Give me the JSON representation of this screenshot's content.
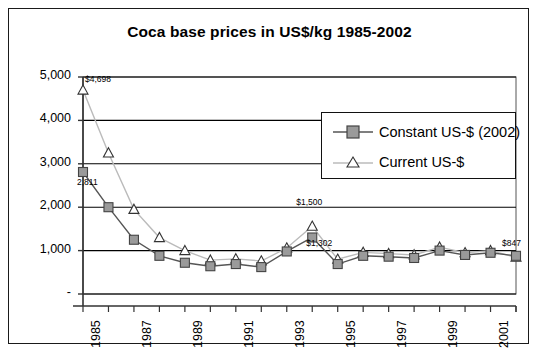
{
  "chart_data": {
    "type": "line",
    "title": "Coca base prices in US$/kg 1985-2002",
    "xlabel": "",
    "ylabel": "",
    "ylim": [
      0,
      5000
    ],
    "ytick_labels": [
      "5,000",
      "4,000",
      "3,000",
      "2,000",
      "1,000",
      "-"
    ],
    "ytick_values": [
      5000,
      4000,
      3000,
      2000,
      1000,
      0
    ],
    "grid": "horizontal",
    "legend_position": "upper-right-inside",
    "x": [
      1985,
      1986,
      1987,
      1988,
      1989,
      1990,
      1991,
      1992,
      1993,
      1994,
      1995,
      1996,
      1997,
      1998,
      1999,
      2000,
      2001,
      2002
    ],
    "xtick_labels": [
      "1985",
      "",
      "1987",
      "",
      "1989",
      "",
      "1991",
      "",
      "1993",
      "",
      "1995",
      "",
      "1997",
      "",
      "1999",
      "",
      "2001",
      ""
    ],
    "series": [
      {
        "name": "Constant US-$ (2002)",
        "marker": "square",
        "marker_fill": "#9a9a9a",
        "line_color": "#555555",
        "values": [
          2811,
          2000,
          1250,
          880,
          720,
          640,
          690,
          620,
          980,
          1302,
          690,
          880,
          860,
          830,
          1000,
          900,
          950,
          880
        ]
      },
      {
        "name": "Current US-$",
        "marker": "triangle",
        "marker_fill": "#ffffff",
        "line_color": "#bbbbbb",
        "values": [
          4698,
          3250,
          1950,
          1300,
          1000,
          780,
          810,
          760,
          1060,
          1560,
          800,
          960,
          930,
          900,
          1080,
          950,
          1000,
          847
        ]
      }
    ],
    "point_labels": [
      {
        "text": "$4,698",
        "year": 1985,
        "series": "Current US-$",
        "value": 4698
      },
      {
        "text": "2,811",
        "year": 1985,
        "series": "Constant US-$ (2002)",
        "value": 2811
      },
      {
        "text": "$1,500",
        "year": 1994,
        "series": "Current US-$",
        "value": 1560
      },
      {
        "text": "$1,302",
        "year": 1994,
        "series": "Constant US-$ (2002)",
        "value": 1302
      },
      {
        "text": "$847",
        "year": 2002,
        "series": "Current US-$",
        "value": 847
      }
    ]
  },
  "legend": {
    "items": [
      {
        "label": "Constant US-$ (2002)",
        "marker": "square-marker"
      },
      {
        "label": "Current US-$",
        "marker": "triangle-marker"
      }
    ]
  },
  "colors": {
    "frame": "#1a1a1a",
    "axis": "#333333",
    "gridline": "#000000",
    "constant_line": "#555555",
    "constant_marker_fill": "#9a9a9a",
    "current_line": "#bbbbbb",
    "current_marker_fill": "#ffffff",
    "text": "#000000",
    "background": "#ffffff"
  }
}
